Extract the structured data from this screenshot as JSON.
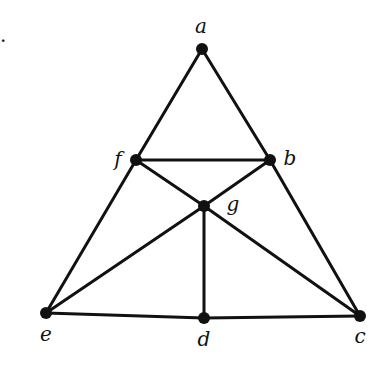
{
  "figure": {
    "marker": ".",
    "type": "graph",
    "vertices": [
      {
        "id": "a",
        "label": "a",
        "x": 202,
        "y": 49,
        "lx": 201,
        "ly": 33
      },
      {
        "id": "b",
        "label": "b",
        "x": 270,
        "y": 160,
        "lx": 290,
        "ly": 165
      },
      {
        "id": "c",
        "label": "c",
        "x": 360,
        "y": 316,
        "lx": 360,
        "ly": 343
      },
      {
        "id": "d",
        "label": "d",
        "x": 204,
        "y": 318,
        "lx": 204,
        "ly": 346
      },
      {
        "id": "e",
        "label": "e",
        "x": 46,
        "y": 313,
        "lx": 46,
        "ly": 341
      },
      {
        "id": "f",
        "label": "f",
        "x": 136,
        "y": 160,
        "lx": 118,
        "ly": 166
      },
      {
        "id": "g",
        "label": "g",
        "x": 204,
        "y": 206,
        "lx": 233,
        "ly": 211
      }
    ],
    "edges": [
      [
        "a",
        "f"
      ],
      [
        "a",
        "b"
      ],
      [
        "f",
        "b"
      ],
      [
        "f",
        "e"
      ],
      [
        "b",
        "c"
      ],
      [
        "f",
        "g"
      ],
      [
        "b",
        "g"
      ],
      [
        "g",
        "e"
      ],
      [
        "g",
        "c"
      ],
      [
        "g",
        "d"
      ],
      [
        "e",
        "d"
      ],
      [
        "d",
        "c"
      ]
    ]
  }
}
